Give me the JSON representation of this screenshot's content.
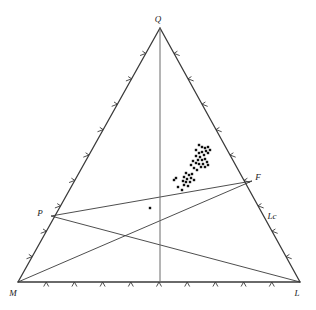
{
  "chart_data": {
    "type": "scatter",
    "title": "",
    "subtitle": "",
    "xlabel": "",
    "ylabel": "",
    "plot_kind": "ternary-classification-diagram",
    "grid": false,
    "legend": "none",
    "vertices": [
      {
        "name": "Q",
        "label": "Q",
        "x": 160,
        "y": 28,
        "label_x": 158,
        "label_y": 22
      },
      {
        "name": "M",
        "label": "M",
        "x": 18,
        "y": 282,
        "label_x": 13,
        "label_y": 296
      },
      {
        "name": "L",
        "label": "L",
        "x": 300,
        "y": 282,
        "label_x": 297,
        "label_y": 296
      }
    ],
    "edge_points": [
      {
        "name": "P",
        "label": "P",
        "x": 51,
        "y": 216,
        "label_x": 40,
        "label_y": 216
      },
      {
        "name": "F",
        "label": "F",
        "x": 252,
        "y": 181,
        "label_x": 258,
        "label_y": 180
      },
      {
        "name": "Lc",
        "label": "Lc",
        "x": 268,
        "y": 216,
        "label_x": 272,
        "label_y": 219
      }
    ],
    "internal_lines": [
      {
        "name": "P-to-F",
        "x1": 51,
        "y1": 216,
        "x2": 252,
        "y2": 181
      },
      {
        "name": "P-to-L",
        "x1": 51,
        "y1": 216,
        "x2": 300,
        "y2": 282
      },
      {
        "name": "M-to-F",
        "x1": 18,
        "y1": 282,
        "x2": 252,
        "y2": 181
      },
      {
        "name": "Q-axis-vertical",
        "x1": 160,
        "y1": 28,
        "x2": 160,
        "y2": 282
      }
    ],
    "tick_counts": {
      "left_edge": 9,
      "right_edge": 9,
      "bottom_edge": 9
    },
    "tick_direction": "outward",
    "data_points": [
      {
        "x": 202,
        "y": 147
      },
      {
        "x": 205,
        "y": 148
      },
      {
        "x": 208,
        "y": 147
      },
      {
        "x": 206,
        "y": 151
      },
      {
        "x": 202,
        "y": 152
      },
      {
        "x": 199,
        "y": 153
      },
      {
        "x": 204,
        "y": 155
      },
      {
        "x": 208,
        "y": 153
      },
      {
        "x": 200,
        "y": 157
      },
      {
        "x": 196,
        "y": 156
      },
      {
        "x": 198,
        "y": 160
      },
      {
        "x": 202,
        "y": 160
      },
      {
        "x": 205,
        "y": 159
      },
      {
        "x": 207,
        "y": 162
      },
      {
        "x": 203,
        "y": 164
      },
      {
        "x": 199,
        "y": 164
      },
      {
        "x": 196,
        "y": 163
      },
      {
        "x": 201,
        "y": 167
      },
      {
        "x": 205,
        "y": 167
      },
      {
        "x": 208,
        "y": 165
      },
      {
        "x": 193,
        "y": 161
      },
      {
        "x": 191,
        "y": 165
      },
      {
        "x": 194,
        "y": 168
      },
      {
        "x": 197,
        "y": 170
      },
      {
        "x": 186,
        "y": 173
      },
      {
        "x": 189,
        "y": 175
      },
      {
        "x": 192,
        "y": 174
      },
      {
        "x": 184,
        "y": 177
      },
      {
        "x": 187,
        "y": 179
      },
      {
        "x": 191,
        "y": 178
      },
      {
        "x": 190,
        "y": 182
      },
      {
        "x": 186,
        "y": 182
      },
      {
        "x": 183,
        "y": 181
      },
      {
        "x": 194,
        "y": 180
      },
      {
        "x": 188,
        "y": 186
      },
      {
        "x": 184,
        "y": 185
      },
      {
        "x": 176,
        "y": 178
      },
      {
        "x": 174,
        "y": 180
      },
      {
        "x": 178,
        "y": 187
      },
      {
        "x": 182,
        "y": 190
      },
      {
        "x": 196,
        "y": 150
      },
      {
        "x": 210,
        "y": 150
      },
      {
        "x": 199,
        "y": 145
      }
    ],
    "isolated_points": [
      {
        "x": 150,
        "y": 208
      }
    ],
    "marker": {
      "shape": "square",
      "size": 2.4,
      "color": "#101010"
    },
    "line_color": "#3a3a3a",
    "background_color": "#ffffff"
  }
}
